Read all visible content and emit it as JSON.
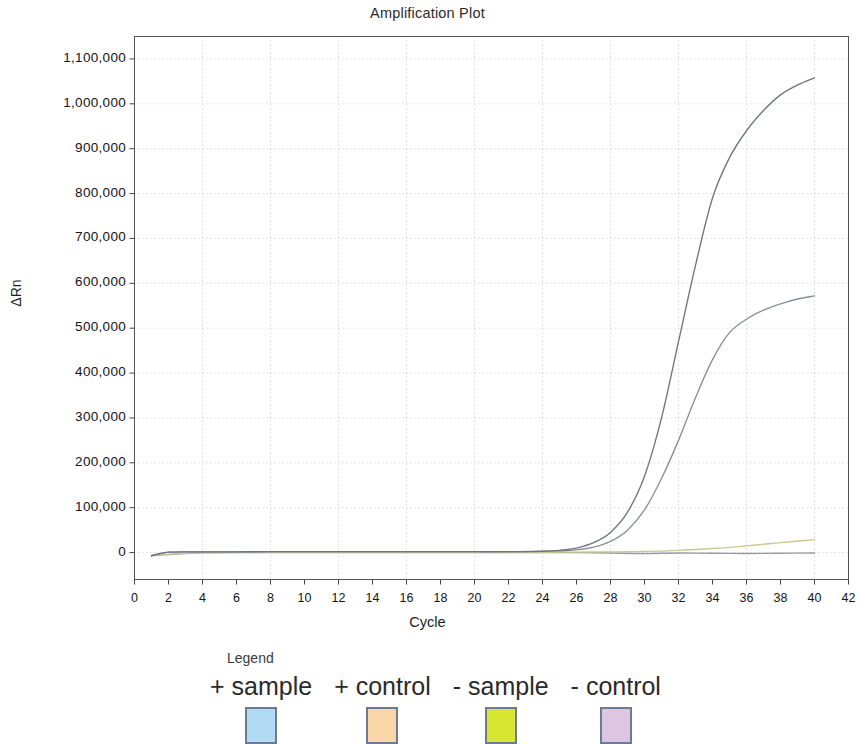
{
  "chart_data": {
    "type": "line",
    "title": "Amplification Plot",
    "xlabel": "Cycle",
    "ylabel": "ΔRn",
    "xlim": [
      0,
      42
    ],
    "ylim": [
      -60000,
      1150000
    ],
    "grid": true,
    "x_ticks": [
      0,
      2,
      4,
      6,
      8,
      10,
      12,
      14,
      16,
      18,
      20,
      22,
      24,
      26,
      28,
      30,
      32,
      34,
      36,
      38,
      40,
      42
    ],
    "x_tick_labels": [
      "0",
      "2",
      "4",
      "6",
      "8",
      "10",
      "12",
      "14",
      "16",
      "18",
      "20",
      "22",
      "24",
      "26",
      "28",
      "30",
      "32",
      "34",
      "36",
      "38",
      "40",
      "42"
    ],
    "y_ticks": [
      0,
      100000,
      200000,
      300000,
      400000,
      500000,
      600000,
      700000,
      800000,
      900000,
      1000000,
      1100000
    ],
    "y_tick_labels": [
      "0",
      "100,000",
      "200,000",
      "300,000",
      "400,000",
      "500,000",
      "600,000",
      "700,000",
      "800,000",
      "900,000",
      "1,000,000",
      "1,100,000"
    ],
    "legend_position": "below",
    "series": [
      {
        "name": "+ sample",
        "color": "#6f7480",
        "x": [
          1,
          2,
          4,
          6,
          8,
          10,
          12,
          14,
          16,
          18,
          20,
          22,
          24,
          25,
          26,
          27,
          28,
          29,
          30,
          31,
          32,
          33,
          34,
          35,
          36,
          37,
          38,
          39,
          40
        ],
        "values": [
          -7000,
          1000,
          1500,
          1500,
          2000,
          2000,
          2000,
          2000,
          2000,
          2000,
          2000,
          2000,
          3000,
          5000,
          10000,
          22000,
          45000,
          90000,
          170000,
          300000,
          470000,
          640000,
          790000,
          880000,
          940000,
          985000,
          1020000,
          1042000,
          1058000
        ]
      },
      {
        "name": "+ control",
        "color": "#8a8f99",
        "x": [
          1,
          2,
          4,
          6,
          8,
          10,
          12,
          14,
          16,
          18,
          20,
          22,
          24,
          26,
          27,
          28,
          29,
          30,
          31,
          32,
          33,
          34,
          35,
          36,
          37,
          38,
          39,
          40
        ],
        "values": [
          -7000,
          1000,
          1500,
          1500,
          2000,
          2000,
          2000,
          2000,
          2000,
          2000,
          2000,
          2000,
          2500,
          6000,
          12000,
          25000,
          50000,
          95000,
          165000,
          250000,
          345000,
          430000,
          490000,
          520000,
          540000,
          554000,
          565000,
          572000
        ]
      },
      {
        "name": "- sample",
        "color": "#c9c98f",
        "x": [
          1,
          4,
          8,
          12,
          16,
          20,
          24,
          26,
          28,
          30,
          32,
          34,
          36,
          38,
          40
        ],
        "values": [
          -6000,
          0,
          500,
          500,
          500,
          500,
          800,
          1000,
          1500,
          2500,
          5000,
          9000,
          15000,
          22000,
          29000
        ]
      },
      {
        "name": "- control",
        "color": "#9a9aa4",
        "x": [
          1,
          4,
          8,
          12,
          16,
          20,
          24,
          26,
          28,
          30,
          32,
          34,
          36,
          38,
          40
        ],
        "values": [
          -7000,
          -500,
          0,
          0,
          0,
          0,
          0,
          0,
          -1000,
          -2000,
          -1000,
          -1500,
          -2000,
          -1500,
          -1000
        ]
      }
    ]
  },
  "legend": {
    "title": "Legend",
    "items": [
      {
        "label": "+ sample",
        "color": "#b2daf2"
      },
      {
        "label": "+ control",
        "color": "#fad7a8"
      },
      {
        "label": "- sample",
        "color": "#d7e630"
      },
      {
        "label": "- control",
        "color": "#ddc6e2"
      }
    ]
  }
}
